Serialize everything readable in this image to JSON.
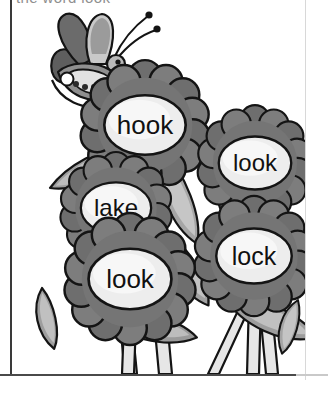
{
  "page": {
    "title_partial": "the word look",
    "background_color": "#ffffff",
    "border_color": "#3a3a3a",
    "border_light_color": "#d8d8d8"
  },
  "artwork": {
    "name": "flowers-and-butterfly-illustration",
    "style": "grayscale line art",
    "palette": {
      "outline": "#1a1a1a",
      "petal_dark": "#6e6e6e",
      "petal_mid": "#8a8a8a",
      "center_light": "#f0f0f0",
      "center_shade": "#dcdcdc",
      "leaf_light": "#b5b5b5",
      "leaf_mid": "#9a9a9a",
      "leaf_dark": "#767676",
      "stem_light": "#e2e2e2",
      "butterfly_dark": "#5e5e5e",
      "butterfly_mid": "#9d9d9d",
      "butterfly_light": "#cfcfcf"
    },
    "butterfly": {
      "name": "butterfly",
      "spot_count": 4,
      "antenna_count": 2
    },
    "flowers": [
      {
        "id": "flower-hook",
        "word": "hook",
        "cx": 133,
        "cy": 125,
        "r": 62,
        "petals": 14,
        "font_size": 26
      },
      {
        "id": "flower-look-top-right",
        "word": "look",
        "cx": 243,
        "cy": 163,
        "r": 54,
        "petals": 14,
        "font_size": 24
      },
      {
        "id": "flower-lake",
        "word": "lake",
        "cx": 104,
        "cy": 208,
        "r": 53,
        "petals": 14,
        "font_size": 24
      },
      {
        "id": "flower-lock",
        "word": "lock",
        "cx": 242,
        "cy": 256,
        "r": 56,
        "petals": 14,
        "font_size": 25
      },
      {
        "id": "flower-look-bottom-left",
        "word": "look",
        "cx": 118,
        "cy": 279,
        "r": 62,
        "petals": 14,
        "font_size": 26
      }
    ],
    "word_list": [
      "hook",
      "look",
      "lake",
      "look",
      "lock"
    ]
  }
}
